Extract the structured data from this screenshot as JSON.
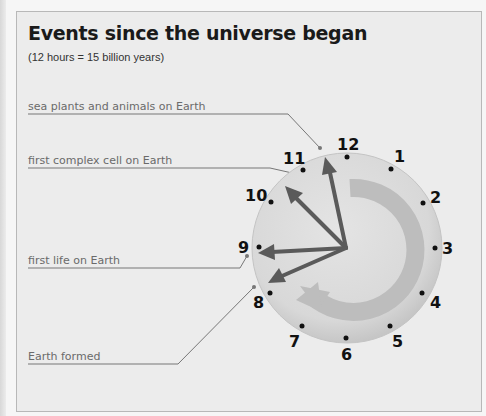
{
  "title": "Events since the universe began",
  "subtitle": "(12 hours = 15 billion years)",
  "events": [
    {
      "label": "sea plants and animals on Earth",
      "hour": 11.8
    },
    {
      "label": "first complex cell on Earth",
      "hour": 10.6
    },
    {
      "label": "first life on Earth",
      "hour": 9.1
    },
    {
      "label": "Earth formed",
      "hour": 8.4
    }
  ],
  "clock": {
    "numbers": [
      "12",
      "1",
      "2",
      "3",
      "4",
      "5",
      "6",
      "7",
      "8",
      "9",
      "10",
      "11"
    ],
    "direction_arrow": "clockwise"
  },
  "colors": {
    "background": "#ececec",
    "clock_face": "#dadada",
    "hands": "#5a5a5a",
    "arrow": "#bdbdbd"
  }
}
